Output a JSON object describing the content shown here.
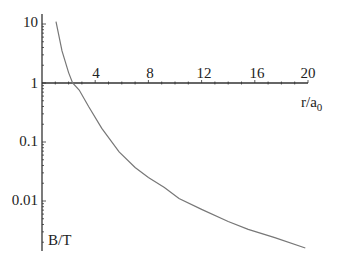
{
  "chart_data": {
    "type": "line",
    "title": "",
    "xlabel": "r/a0",
    "xlabel_main": "r/a",
    "xlabel_sub": "0",
    "ylabel": "B/T",
    "yscale": "log",
    "xlim": [
      0,
      20
    ],
    "ylim": [
      0.002,
      12
    ],
    "grid": false,
    "legend": null,
    "x_ticks": [
      "4",
      "8",
      "12",
      "16",
      "20"
    ],
    "y_ticks": [
      "10",
      "1",
      "0.1",
      "0.01"
    ],
    "series": [
      {
        "name": "B(r)",
        "color": "#777777",
        "x": [
          1.05,
          1.5,
          2.0,
          2.3,
          2.8,
          3.5,
          4.5,
          5.8,
          7.0,
          8.0,
          9.2,
          10.3,
          12.0,
          14.0,
          15.5,
          17.5,
          19.8
        ],
        "y": [
          11.0,
          3.5,
          1.5,
          1.0,
          0.76,
          0.4,
          0.17,
          0.068,
          0.037,
          0.025,
          0.017,
          0.011,
          0.0072,
          0.0045,
          0.0033,
          0.0024,
          0.0016
        ]
      }
    ]
  },
  "axes": {
    "x_tick_labels": [
      "4",
      "8",
      "12",
      "16",
      "20"
    ],
    "y_tick_labels": [
      "10",
      "1",
      "0.1",
      "0.01"
    ],
    "x_label": "r/a",
    "x_label_subscript": "0",
    "y_label": "B/T"
  },
  "colors": {
    "axis": "#333333",
    "curve": "#777777",
    "text": "#222222"
  }
}
